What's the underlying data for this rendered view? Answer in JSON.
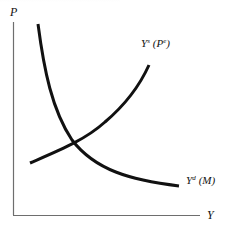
{
  "diagram": {
    "type": "supply-demand",
    "axes": {
      "y_label": "P",
      "x_label": "Y"
    },
    "curves": [
      {
        "id": "aggregate-supply",
        "label_main": "Y",
        "label_sup": "s",
        "label_arg": "(P",
        "label_arg_sup": "e",
        "label_arg_close": ")",
        "shape": "upward-sloping convex"
      },
      {
        "id": "aggregate-demand",
        "label_main": "Y",
        "label_sup": "d",
        "label_arg": "(M)",
        "shape": "downward-sloping convex"
      }
    ],
    "colors": {
      "curve": "#111111",
      "axis": "#6e6e6e",
      "background": "#ffffff"
    }
  }
}
